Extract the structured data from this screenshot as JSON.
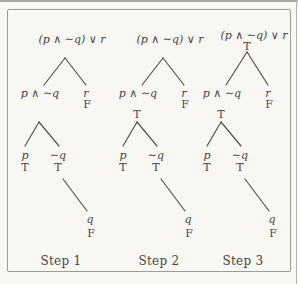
{
  "palette": {
    "page_bg": "#f8f7f4",
    "frame_border": "#9d9c96",
    "ink": "#47453f",
    "edge_line": "#55534d"
  },
  "trees": [
    {
      "step_label": "Step 1",
      "root": {
        "label": "(p ∧ ∼q) ∨ r",
        "value": null
      },
      "left": {
        "label": "p ∧ ∼q",
        "value": null
      },
      "right": {
        "label": "r",
        "value": "F"
      },
      "leaf_p": {
        "label": "p",
        "value": "T"
      },
      "leaf_nq": {
        "label": "∼q",
        "value": "T"
      },
      "leaf_q": {
        "label": "q",
        "value": "F"
      }
    },
    {
      "step_label": "Step 2",
      "root": {
        "label": "(p ∧ ∼q) ∨ r",
        "value": null
      },
      "left": {
        "label": "p ∧ ∼q",
        "value": "T"
      },
      "right": {
        "label": "r",
        "value": "F"
      },
      "leaf_p": {
        "label": "p",
        "value": "T"
      },
      "leaf_nq": {
        "label": "∼q",
        "value": "T"
      },
      "leaf_q": {
        "label": "q",
        "value": "F"
      }
    },
    {
      "step_label": "Step 3",
      "root": {
        "label": "(p ∧ ∼q) ∨ r",
        "value": "T"
      },
      "left": {
        "label": "p ∧ ∼q",
        "value": "T"
      },
      "right": {
        "label": "r",
        "value": "F"
      },
      "leaf_p": {
        "label": "p",
        "value": "T"
      },
      "leaf_nq": {
        "label": "∼q",
        "value": "T"
      },
      "leaf_q": {
        "label": "q",
        "value": "F"
      }
    }
  ]
}
